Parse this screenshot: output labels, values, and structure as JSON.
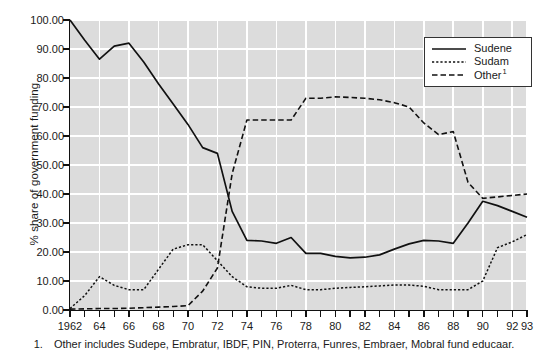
{
  "chart_data": {
    "type": "line",
    "title": "",
    "xlabel": "",
    "ylabel": "% share of government funding",
    "ylim": [
      0,
      100
    ],
    "xlim": [
      1962,
      1993
    ],
    "grid": true,
    "legend_position": "top-right",
    "x": [
      1962,
      1963,
      1964,
      1965,
      1966,
      1967,
      1968,
      1969,
      1970,
      1971,
      1972,
      1973,
      1974,
      1975,
      1976,
      1977,
      1978,
      1979,
      1980,
      1981,
      1982,
      1983,
      1984,
      1985,
      1986,
      1987,
      1988,
      1989,
      1990,
      1991,
      1992,
      1993
    ],
    "x_tick_labels": [
      "1962",
      "64",
      "66",
      "68",
      "70",
      "72",
      "74",
      "76",
      "78",
      "80",
      "82",
      "84",
      "86",
      "88",
      "90",
      "92",
      "93"
    ],
    "x_tick_values": [
      1962,
      1964,
      1966,
      1968,
      1970,
      1972,
      1974,
      1976,
      1978,
      1980,
      1982,
      1984,
      1986,
      1988,
      1990,
      1992,
      1993
    ],
    "y_tick_labels": [
      "100.00",
      "90.00",
      "80.00",
      "70.00",
      "60.00",
      "50.00",
      "40.00",
      "30.00",
      "20.00",
      "10.00",
      "0.00"
    ],
    "y_tick_values": [
      100,
      90,
      80,
      70,
      60,
      50,
      40,
      30,
      20,
      10,
      0
    ],
    "series": [
      {
        "name": "Sudene",
        "style": "solid",
        "color": "#111111",
        "values": [
          100.0,
          93.0,
          86.5,
          91.0,
          92.0,
          85.5,
          78.0,
          71.0,
          64.0,
          56.0,
          54.0,
          34.0,
          24.0,
          23.8,
          23.0,
          25.0,
          19.5,
          19.5,
          18.5,
          18.0,
          18.2,
          19.0,
          21.0,
          22.8,
          24.0,
          23.8,
          23.0,
          30.0,
          37.5,
          36.0,
          34.0,
          32.0
        ]
      },
      {
        "name": "Sudam",
        "style": "dotted",
        "color": "#111111",
        "values": [
          0.5,
          5.0,
          11.5,
          8.5,
          7.0,
          7.0,
          14.0,
          21.0,
          22.5,
          22.5,
          17.0,
          11.5,
          8.0,
          7.5,
          7.5,
          8.5,
          7.0,
          7.0,
          7.5,
          7.8,
          8.0,
          8.3,
          8.6,
          8.6,
          8.2,
          7.0,
          7.0,
          7.0,
          10.0,
          21.5,
          23.5,
          26.0
        ]
      },
      {
        "name": "Other",
        "style": "dashed",
        "footnote_marker": "1",
        "color": "#111111",
        "values": [
          0.3,
          0.4,
          0.5,
          0.5,
          0.6,
          0.8,
          1.0,
          1.2,
          1.5,
          6.5,
          14.5,
          47.0,
          65.5,
          65.5,
          65.5,
          65.5,
          73.0,
          73.0,
          73.5,
          73.3,
          73.0,
          72.5,
          71.5,
          70.0,
          64.5,
          60.5,
          61.5,
          44.0,
          38.5,
          39.0,
          39.5,
          40.0
        ]
      }
    ]
  },
  "legend": {
    "items": [
      {
        "label": "Sudene",
        "marker": ""
      },
      {
        "label": "Sudam",
        "marker": ""
      },
      {
        "label": "Other",
        "marker": "1"
      }
    ]
  },
  "footnote": {
    "marker": "1.",
    "text": "Other includes Sudepe, Embratur, IBDF, PIN, Proterra, Funres, Embraer, Mobral fund educaar."
  }
}
